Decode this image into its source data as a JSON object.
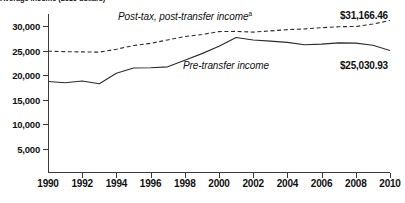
{
  "chart_data": {
    "type": "line",
    "title": "Average income (2010 dollars)",
    "xlabel": "",
    "ylabel": "",
    "xlim": [
      1990,
      2010
    ],
    "ylim": [
      0,
      32500
    ],
    "grid": false,
    "legend_position": "inline-annotations",
    "x": [
      1990,
      1991,
      1992,
      1993,
      1994,
      1995,
      1996,
      1997,
      1998,
      1999,
      2000,
      2001,
      2002,
      2003,
      2004,
      2005,
      2006,
      2007,
      2008,
      2009,
      2010
    ],
    "xticks": [
      "1990",
      "1992",
      "1994",
      "1996",
      "1998",
      "2000",
      "2002",
      "2004",
      "2006",
      "2008",
      "2010"
    ],
    "yticks": [
      "5,000",
      "10,000",
      "15,000",
      "20,000",
      "25,000",
      "30,000"
    ],
    "ytick_values": [
      5000,
      10000,
      15000,
      20000,
      25000,
      30000
    ],
    "series": [
      {
        "name": "Post-tax, post-transfer income",
        "note_marker": "a",
        "style": "dashed",
        "end_value_label": "$31,166.46",
        "end_value": 31166.46,
        "values": [
          24900,
          24800,
          24750,
          24700,
          25300,
          26050,
          26500,
          27200,
          27900,
          28300,
          28900,
          28950,
          28800,
          29050,
          29300,
          29450,
          29700,
          29900,
          29950,
          30450,
          31166
        ]
      },
      {
        "name": "Pre-transfer income",
        "style": "solid",
        "end_value_label": "$25,030.93",
        "end_value": 25030.93,
        "values": [
          18700,
          18450,
          18800,
          18250,
          20400,
          21450,
          21500,
          21700,
          23050,
          24400,
          25900,
          27700,
          27200,
          26950,
          26700,
          26200,
          26350,
          26600,
          26550,
          26100,
          25031
        ]
      }
    ]
  },
  "annotations": {
    "posttax_label": "Post-tax, post-transfer income",
    "posttax_marker": "a",
    "pretax_label": "Pre-transfer income",
    "posttax_value": "$31,166.46",
    "pretax_value": "$25,030.93"
  },
  "colors": {
    "axis": "#3a3a3a",
    "line": "#2b2b2b",
    "text": "#111111",
    "background": "#ffffff"
  }
}
